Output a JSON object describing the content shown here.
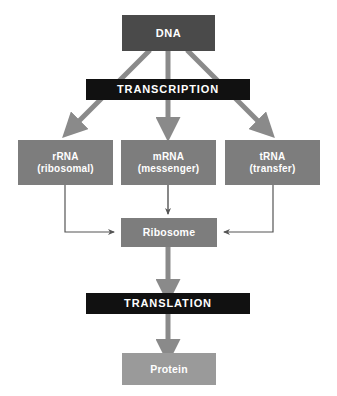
{
  "diagram": {
    "canvas": {
      "width": 337,
      "height": 396,
      "background": "#ffffff"
    },
    "colors": {
      "dna_box": "#4a4a4a",
      "process_bar": "#111111",
      "rna_box": "#7d7d7d",
      "ribosome_box": "#7d7d7d",
      "protein_box": "#9a9a9a",
      "thick_arrow": "#8a8a8a",
      "thin_arrow": "#555555",
      "text": "#ffffff"
    },
    "nodes": {
      "dna": {
        "label": "DNA"
      },
      "transcription": {
        "label": "TRANSCRIPTION"
      },
      "rrna": {
        "line1": "rRNA",
        "line2": "(ribosomal)"
      },
      "mrna": {
        "line1": "mRNA",
        "line2": "(messenger)"
      },
      "trna": {
        "line1": "tRNA",
        "line2": "(transfer)"
      },
      "ribosome": {
        "label": "Ribosome"
      },
      "translation": {
        "label": "TRANSLATION"
      },
      "protein": {
        "label": "Protein"
      }
    },
    "edges": [
      {
        "from": "dna",
        "to": "rrna",
        "style": "thick-arrow"
      },
      {
        "from": "dna",
        "to": "mrna",
        "style": "thick-arrow"
      },
      {
        "from": "dna",
        "to": "trna",
        "style": "thick-arrow"
      },
      {
        "from": "rrna",
        "to": "ribosome",
        "style": "thin-arrow"
      },
      {
        "from": "mrna",
        "to": "ribosome",
        "style": "thick-arrow"
      },
      {
        "from": "trna",
        "to": "ribosome",
        "style": "thin-arrow"
      },
      {
        "from": "ribosome",
        "to": "translation",
        "style": "thick-arrow"
      },
      {
        "from": "translation",
        "to": "protein",
        "style": "thick-arrow"
      }
    ]
  }
}
